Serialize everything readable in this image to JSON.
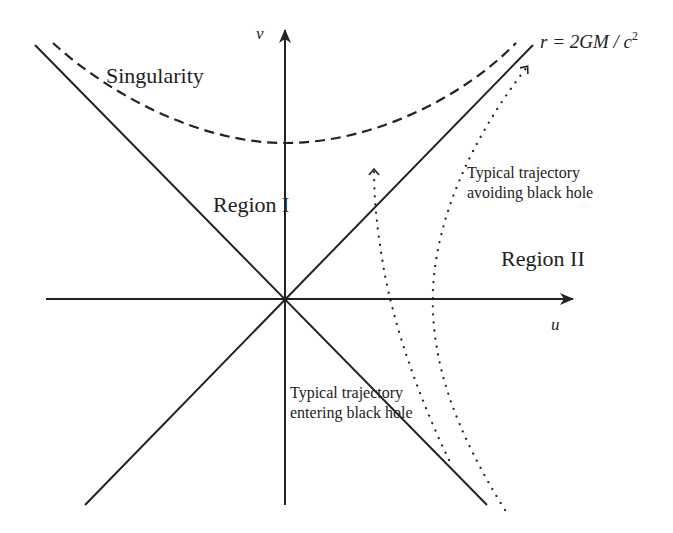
{
  "diagram": {
    "type": "spacetime-diagram",
    "axes": {
      "vertical_label": "v",
      "horizontal_label": "u"
    },
    "labels": {
      "singularity": "Singularity",
      "horizon_prefix": "r = 2GM / c",
      "horizon_exponent": "2",
      "region_1": "Region I",
      "region_2": "Region II",
      "avoiding_line1": "Typical trajectory",
      "avoiding_line2": "avoiding black hole",
      "entering_line1": "Typical trajectory",
      "entering_line2": "entering black hole"
    },
    "colors": {
      "ink": "#222222",
      "background": "#ffffff"
    }
  }
}
